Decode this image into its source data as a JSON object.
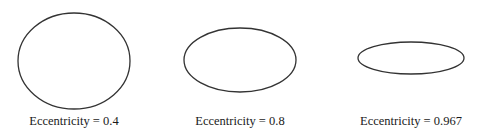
{
  "figure": {
    "stroke_color": "#333333",
    "panels": [
      {
        "label": "Eccentricity = 0.4",
        "eccentricity": 0.4,
        "cx": 74,
        "cy": 61,
        "rx": 56,
        "ry": 48
      },
      {
        "label": "Eccentricity = 0.8",
        "eccentricity": 0.8,
        "cx": 240,
        "cy": 60,
        "rx": 56,
        "ry": 32
      },
      {
        "label": "Eccentricity = 0.967",
        "eccentricity": 0.967,
        "cx": 411,
        "cy": 58,
        "rx": 53,
        "ry": 16
      }
    ]
  }
}
